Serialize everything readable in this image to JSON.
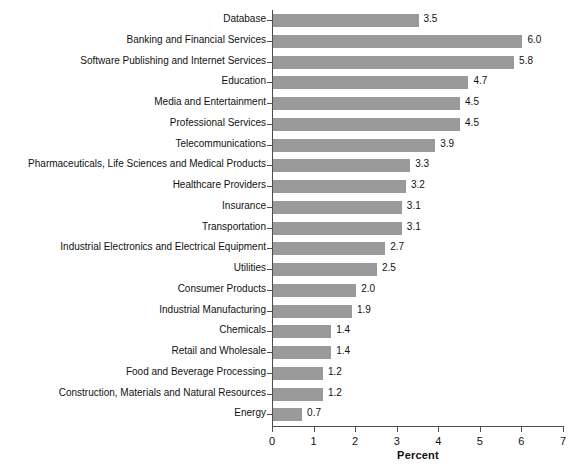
{
  "chart_data": {
    "type": "bar",
    "orientation": "horizontal",
    "title": "",
    "subtitle": "",
    "xlabel": "Percent",
    "ylabel": "",
    "xlim": [
      0,
      7
    ],
    "xticks": [
      "0",
      "1",
      "2",
      "3",
      "4",
      "5",
      "6",
      "7"
    ],
    "grid": false,
    "legend": null,
    "bar_color": "#9a9a9a",
    "axis_color": "#4d4d4d",
    "text_color": "#111111",
    "background": "#ffffff",
    "categories": [
      "Database",
      "Banking and Financial Services",
      "Software Publishing and Internet Services",
      "Education",
      "Media and Entertainment",
      "Professional Services",
      "Telecommunications",
      "Pharmaceuticals, Life Sciences and Medical Products",
      "Healthcare Providers",
      "Insurance",
      "Transportation",
      "Industrial Electronics and Electrical Equipment",
      "Utilities",
      "Consumer Products",
      "Industrial Manufacturing",
      "Chemicals",
      "Retail and Wholesale",
      "Food and Beverage Processing",
      "Construction, Materials and Natural Resources",
      "Energy"
    ],
    "values": [
      3.5,
      6.0,
      5.8,
      4.7,
      4.5,
      4.5,
      3.9,
      3.3,
      3.2,
      3.1,
      3.1,
      2.7,
      2.5,
      2.0,
      1.9,
      1.4,
      1.4,
      1.2,
      1.2,
      0.7
    ],
    "value_labels": [
      "3.5",
      "6.0",
      "5.8",
      "4.7",
      "4.5",
      "4.5",
      "3.9",
      "3.3",
      "3.2",
      "3.1",
      "3.1",
      "2.7",
      "2.5",
      "2.0",
      "1.9",
      "1.4",
      "1.4",
      "1.2",
      "1.2",
      "0.7"
    ]
  }
}
